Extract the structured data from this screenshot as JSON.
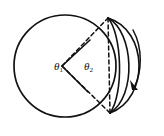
{
  "figure": {
    "type": "geometry-diagram",
    "background_color": "#ffffff",
    "stroke_color": "#111111",
    "labels": [
      {
        "id": "theta1",
        "symbol": "θ",
        "subscript": "1",
        "x": 54,
        "y": 61
      },
      {
        "id": "theta2",
        "symbol": "θ",
        "subscript": "2",
        "x": 84,
        "y": 61
      }
    ],
    "main_circle": {
      "center_x": 65,
      "center_y": 66,
      "radius": 51,
      "style": "solid"
    },
    "vertex_top": {
      "x": 108,
      "y": 18
    },
    "vertex_bottom": {
      "x": 110,
      "y": 113
    },
    "angle_vertex": {
      "x": 62,
      "y": 66
    },
    "dashed_chord_label": "chord from top vertex to bottom vertex",
    "arcs": [
      {
        "id": "arc-1",
        "bulge": 26,
        "style": "solid"
      },
      {
        "id": "arc-2",
        "bulge": 42,
        "style": "solid"
      },
      {
        "id": "arc-3",
        "bulge": 56,
        "style": "solid"
      }
    ],
    "rotation_arrow": {
      "direction": "clockwise-downward",
      "arrowhead_x": 136,
      "arrowhead_y": 88
    }
  }
}
